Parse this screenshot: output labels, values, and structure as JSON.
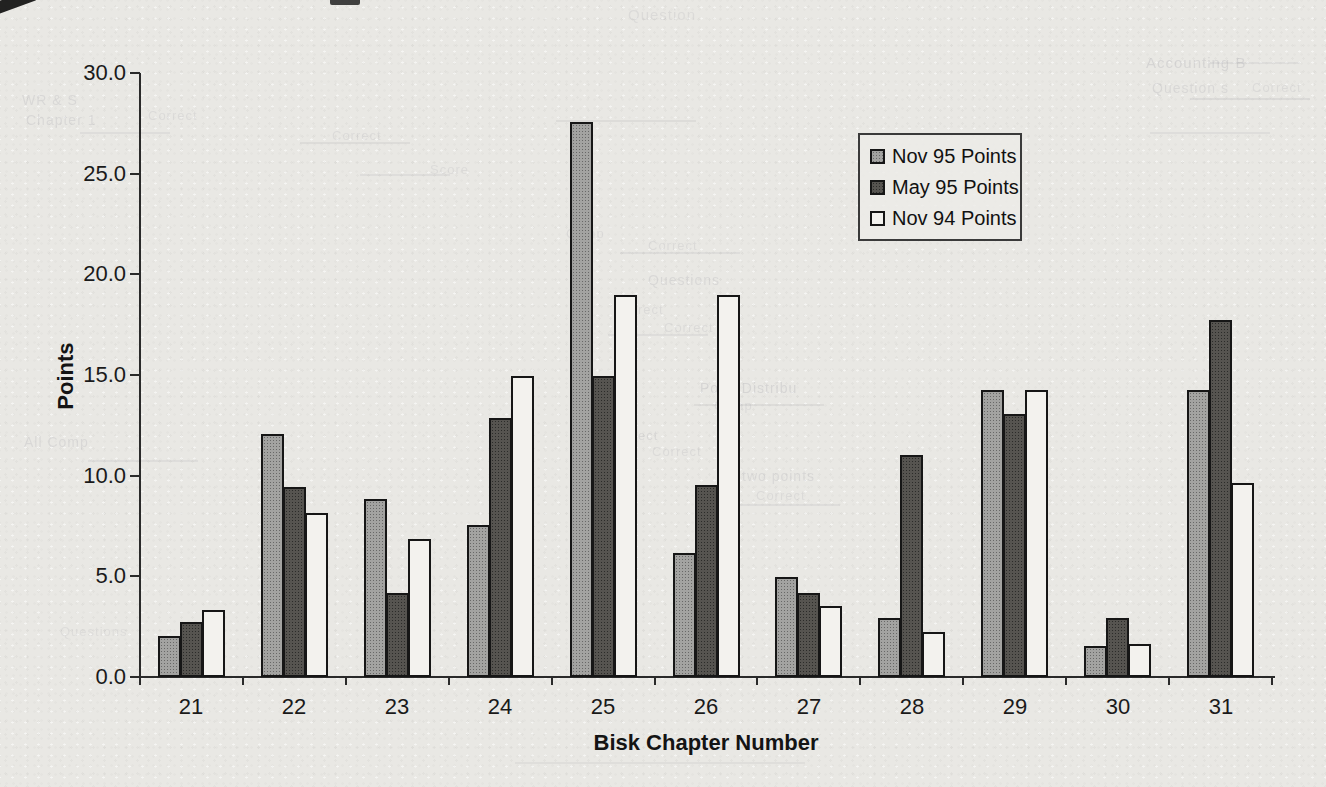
{
  "colors": {
    "paper": "#e9e8e4",
    "ink": "#1a1a1a",
    "bar_nov95": "#a3a3a1",
    "bar_may95": "#565450",
    "bar_nov94": "#f3f2ee",
    "bar_outline": "#161616"
  },
  "chart_data": {
    "type": "bar",
    "title": "",
    "xlabel": "Bisk Chapter Number",
    "ylabel": "Points",
    "categories": [
      "21",
      "22",
      "23",
      "24",
      "25",
      "26",
      "27",
      "28",
      "29",
      "30",
      "31"
    ],
    "series": [
      {
        "name": "Nov 95 Points",
        "key": "nov95",
        "values": [
          2.0,
          12.0,
          8.8,
          7.5,
          27.5,
          6.1,
          4.9,
          2.9,
          14.2,
          1.5,
          14.2
        ]
      },
      {
        "name": "May 95 Points",
        "key": "may95",
        "values": [
          2.7,
          9.4,
          4.1,
          12.8,
          14.9,
          9.5,
          4.1,
          11.0,
          13.0,
          2.9,
          17.7
        ]
      },
      {
        "name": "Nov 94 Points",
        "key": "nov94",
        "values": [
          3.3,
          8.1,
          6.8,
          14.9,
          18.9,
          18.9,
          3.5,
          2.2,
          14.2,
          1.6,
          9.6
        ]
      }
    ],
    "ylim": [
      0,
      30
    ],
    "y_ticks": [
      0,
      5,
      10,
      15,
      20,
      25,
      30
    ],
    "y_tick_labels": [
      "0.0",
      "5.0",
      "10.0",
      "15.0",
      "20.0",
      "25.0",
      "30.0"
    ],
    "grid": false,
    "legend_position": "upper-right"
  },
  "scan_artifacts": {
    "bleed_text": [
      {
        "t": "Question",
        "x": 628,
        "y": 6,
        "s": 15,
        "o": 0.09
      },
      {
        "t": "Accounting B",
        "x": 1146,
        "y": 54,
        "s": 15,
        "o": 0.13
      },
      {
        "t": "Question s",
        "x": 1152,
        "y": 80,
        "s": 14,
        "o": 0.11
      },
      {
        "t": "Correct",
        "x": 1252,
        "y": 80,
        "s": 13,
        "o": 0.09
      },
      {
        "t": "WR & S",
        "x": 22,
        "y": 92,
        "s": 14,
        "o": 0.11
      },
      {
        "t": "Chapter 1",
        "x": 26,
        "y": 112,
        "s": 14,
        "o": 0.11
      },
      {
        "t": "Correct",
        "x": 148,
        "y": 108,
        "s": 13,
        "o": 0.09
      },
      {
        "t": "Correct",
        "x": 332,
        "y": 128,
        "s": 13,
        "o": 0.09
      },
      {
        "t": "Score",
        "x": 430,
        "y": 162,
        "s": 13,
        "o": 0.09
      },
      {
        "t": "Comp",
        "x": 566,
        "y": 226,
        "s": 13,
        "o": 0.09
      },
      {
        "t": "Correct",
        "x": 648,
        "y": 238,
        "s": 13,
        "o": 0.09
      },
      {
        "t": "Questions",
        "x": 648,
        "y": 272,
        "s": 14,
        "o": 0.11
      },
      {
        "t": "Correct",
        "x": 614,
        "y": 302,
        "s": 13,
        "o": 0.09
      },
      {
        "t": "Correct",
        "x": 664,
        "y": 320,
        "s": 13,
        "o": 0.09
      },
      {
        "t": "Point Distribu",
        "x": 700,
        "y": 380,
        "s": 14,
        "o": 0.13
      },
      {
        "t": "Comp",
        "x": 714,
        "y": 398,
        "s": 13,
        "o": 0.09
      },
      {
        "t": "4 Correct",
        "x": 596,
        "y": 428,
        "s": 13,
        "o": 0.11
      },
      {
        "t": "Correct",
        "x": 652,
        "y": 444,
        "s": 13,
        "o": 0.09
      },
      {
        "t": "two points",
        "x": 742,
        "y": 468,
        "s": 14,
        "o": 0.11
      },
      {
        "t": "Correct",
        "x": 756,
        "y": 488,
        "s": 13,
        "o": 0.09
      },
      {
        "t": "All Comp",
        "x": 24,
        "y": 434,
        "s": 14,
        "o": 0.11
      },
      {
        "t": "Questions",
        "x": 60,
        "y": 624,
        "s": 13,
        "o": 0.08
      }
    ],
    "bleed_rules": [
      {
        "x": 300,
        "y": 142,
        "w": 110,
        "o": 0.09
      },
      {
        "x": 556,
        "y": 120,
        "w": 140,
        "o": 0.09
      },
      {
        "x": 1190,
        "y": 98,
        "w": 120,
        "o": 0.1
      },
      {
        "x": 1210,
        "y": 62,
        "w": 90,
        "o": 0.08
      },
      {
        "x": 608,
        "y": 334,
        "w": 100,
        "o": 0.08
      },
      {
        "x": 694,
        "y": 404,
        "w": 130,
        "o": 0.09
      },
      {
        "x": 88,
        "y": 460,
        "w": 110,
        "o": 0.08
      },
      {
        "x": 360,
        "y": 174,
        "w": 90,
        "o": 0.08
      },
      {
        "x": 620,
        "y": 252,
        "w": 120,
        "o": 0.08
      },
      {
        "x": 80,
        "y": 132,
        "w": 90,
        "o": 0.08
      },
      {
        "x": 740,
        "y": 504,
        "w": 100,
        "o": 0.08
      },
      {
        "x": 1150,
        "y": 132,
        "w": 120,
        "o": 0.08
      },
      {
        "x": 515,
        "y": 762,
        "w": 290,
        "o": 0.07
      }
    ]
  }
}
